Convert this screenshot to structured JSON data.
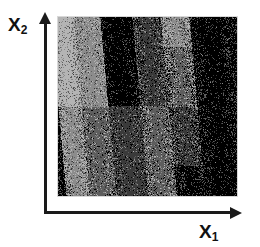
{
  "figure": {
    "background": "#ffffff",
    "axes": {
      "x": {
        "name": "x-axis",
        "label": "X",
        "subscript": "1",
        "color": "#1a1a1a",
        "arrow": "right-arrow"
      },
      "y": {
        "name": "y-axis",
        "label": "X",
        "subscript": "2",
        "color": "#1a1a1a",
        "arrow": "up-arrow"
      }
    }
  },
  "chart_data": {
    "type": "heatmap",
    "title": "",
    "subtitle": "",
    "xlabel": "X1",
    "ylabel": "X2",
    "xlim": [
      0,
      1
    ],
    "ylim": [
      0,
      1
    ],
    "grid": false,
    "legend": null,
    "palette": [
      "#000000",
      "#3a3a3a",
      "#5e5e5e",
      "#8c8c8c",
      "#b4b4b4"
    ],
    "levels": [
      {
        "name": "black",
        "color": "#000000",
        "value": 0
      },
      {
        "name": "dark-gray",
        "color": "#3a3a3a",
        "value": 1
      },
      {
        "name": "mid-gray",
        "color": "#5e5e5e",
        "value": 2
      },
      {
        "name": "gray",
        "color": "#8c8c8c",
        "value": 3
      },
      {
        "name": "light-gray",
        "color": "#b4b4b4",
        "value": 4
      }
    ],
    "bands": [
      {
        "x_start": 0.0,
        "x_end": 0.13,
        "top_level": 4,
        "bottom_level": 3,
        "noise": 0.55
      },
      {
        "x_start": 0.13,
        "x_end": 0.28,
        "top_level": 3,
        "bottom_level": 2,
        "noise": 0.35
      },
      {
        "x_start": 0.28,
        "x_end": 0.46,
        "top_level": 0,
        "bottom_level": 1,
        "noise": 0.3
      },
      {
        "x_start": 0.46,
        "x_end": 0.62,
        "top_level": 1,
        "bottom_level": 2,
        "noise": 0.45
      },
      {
        "x_start": 0.62,
        "x_end": 0.78,
        "top_level": 3,
        "bottom_level": 0,
        "noise": 0.6
      },
      {
        "x_start": 0.78,
        "x_end": 1.0,
        "top_level": 0,
        "bottom_level": 0,
        "noise": 0.4
      }
    ],
    "boundaries": [
      {
        "name": "boundary-1",
        "x_top": 0.16,
        "x_bottom": 0.1,
        "sharpness": "diffuse"
      },
      {
        "name": "boundary-2",
        "x_top": 0.3,
        "x_bottom": 0.38,
        "sharpness": "sharp"
      },
      {
        "name": "boundary-3",
        "x_top": 0.48,
        "x_bottom": 0.56,
        "sharpness": "diffuse"
      },
      {
        "name": "boundary-4",
        "x_top": 0.66,
        "x_bottom": 0.74,
        "sharpness": "diffuse"
      },
      {
        "name": "boundary-5",
        "x_top": 0.86,
        "x_bottom": 0.92,
        "sharpness": "diffuse"
      }
    ]
  }
}
